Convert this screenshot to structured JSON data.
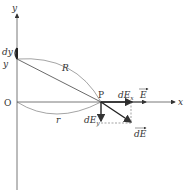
{
  "diagram": {
    "axes": {
      "x_label": "x",
      "y_label": "y",
      "origin_label": "O"
    },
    "labels": {
      "dy": "dy",
      "y": "y",
      "R": "R",
      "r": "r",
      "P": "P",
      "dEx": "dE",
      "dEx_sub": "x",
      "dEy": "dE",
      "dEy_sub": "y",
      "E": "E",
      "dE": "dE"
    },
    "colors": {
      "line": "#444444",
      "text": "#333333",
      "background": "#ffffff"
    }
  }
}
